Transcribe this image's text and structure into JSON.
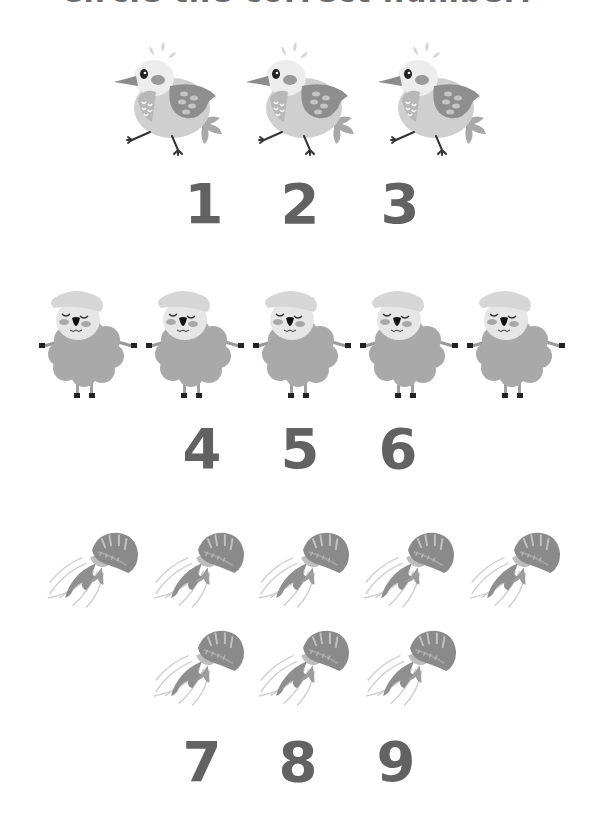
{
  "worksheet": {
    "title": "Circle the correct number:",
    "groups": [
      {
        "name": "birds",
        "count": 3,
        "options": [
          "1",
          "2",
          "3"
        ]
      },
      {
        "name": "sheep",
        "count": 5,
        "options": [
          "4",
          "5",
          "6"
        ]
      },
      {
        "name": "jellyfish",
        "count": 8,
        "options": [
          "7",
          "8",
          "9"
        ]
      }
    ]
  },
  "colors": {
    "number": "#626262",
    "title": "#6a6a6a",
    "illustration_dark": "#8a8a8a",
    "illustration_mid": "#b5b5b5",
    "illustration_light": "#dcdcdc"
  }
}
